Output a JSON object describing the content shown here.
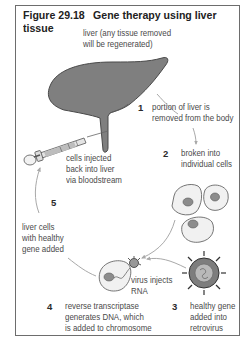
{
  "figure": {
    "number": "Figure 29.18",
    "title": "Gene therapy using liver tissue",
    "title_line1": "Gene therapy using liver",
    "title_line2": "tissue"
  },
  "labels": {
    "liver": [
      "liver (any tissue removed",
      "will be regenerated)"
    ],
    "step1": [
      "portion of liver is",
      "removed from the body"
    ],
    "step2": [
      "broken into",
      "individual cells"
    ],
    "step3": [
      "healthy gene",
      "added into",
      "retrovirus"
    ],
    "step4": [
      "reverse transcriptase",
      "generates DNA, which",
      "is added to chromosome"
    ],
    "virus_injects": [
      "virus injects",
      "RNA"
    ],
    "step5": [
      "liver cells",
      "with healthy",
      "gene added"
    ],
    "injected": [
      "cells injected",
      "back into liver",
      "via bloodstream"
    ]
  },
  "steps": [
    "1",
    "2",
    "3",
    "4",
    "5"
  ],
  "colors": {
    "liver_fill": "#7f7f7f",
    "liver_stroke": "#4a4a4a",
    "arrow": "#a9a9a9",
    "cell_fill": "#f1f1f1",
    "nucleus_fill": "#8c8c8c",
    "frame_border": "#6d6d6d"
  }
}
